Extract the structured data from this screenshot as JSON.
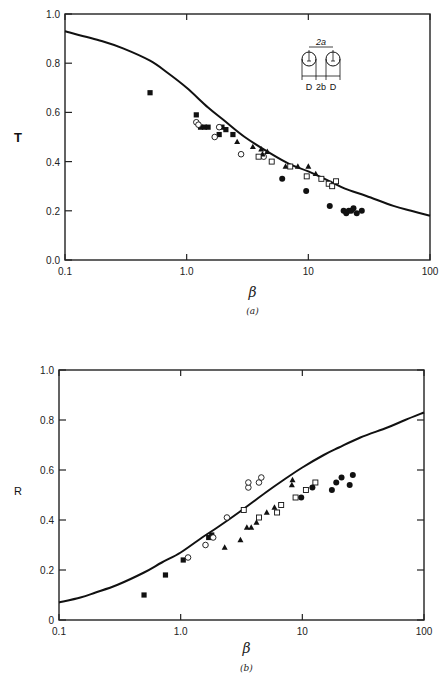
{
  "chart_data": [
    {
      "panel": "(a)",
      "type": "scatter",
      "title": "",
      "xlabel": "β",
      "ylabel": "T",
      "xscale": "log",
      "xlim": [
        0.1,
        100
      ],
      "ylim": [
        0.0,
        1.0
      ],
      "xticks": [
        "0.1",
        "1.0",
        "10",
        "100"
      ],
      "yticks": [
        "0.0",
        "0.2",
        "0.4",
        "0.6",
        "0.8",
        "1.0"
      ],
      "grid": false,
      "legend": null,
      "inset_labels": [
        "2a",
        "D",
        "2b",
        "D"
      ],
      "theory_curve": {
        "x": [
          0.1,
          0.2,
          0.3,
          0.5,
          0.7,
          1.0,
          1.5,
          2.0,
          3.0,
          5.0,
          7.0,
          10,
          15,
          20,
          30,
          50,
          70,
          100
        ],
        "y": [
          0.93,
          0.89,
          0.86,
          0.81,
          0.76,
          0.7,
          0.62,
          0.57,
          0.5,
          0.43,
          0.39,
          0.36,
          0.32,
          0.29,
          0.26,
          0.22,
          0.2,
          0.18
        ]
      },
      "series": [
        {
          "name": "filled-square",
          "marker": "■",
          "x": [
            0.5,
            1.2,
            1.3,
            1.4,
            1.5,
            1.85,
            1.95,
            2.1,
            2.4
          ],
          "y": [
            0.68,
            0.59,
            0.54,
            0.54,
            0.54,
            0.51,
            0.54,
            0.53,
            0.51
          ]
        },
        {
          "name": "open-circle",
          "marker": "○",
          "x": [
            1.2,
            1.25,
            1.7,
            1.85,
            2.8,
            4.3
          ],
          "y": [
            0.56,
            0.55,
            0.5,
            0.54,
            0.43,
            0.42
          ]
        },
        {
          "name": "filled-triangle",
          "marker": "▲",
          "x": [
            2.6,
            3.5,
            4.1,
            4.2,
            4.6,
            6.5,
            8.2,
            10.0,
            11.5
          ],
          "y": [
            0.48,
            0.46,
            0.45,
            0.43,
            0.44,
            0.38,
            0.38,
            0.38,
            0.35
          ]
        },
        {
          "name": "open-square",
          "marker": "□",
          "x": [
            3.9,
            5.0,
            7.1,
            9.7,
            12.8,
            14.7,
            15.7,
            16.9
          ],
          "y": [
            0.42,
            0.4,
            0.38,
            0.34,
            0.33,
            0.31,
            0.3,
            0.32
          ]
        },
        {
          "name": "filled-circle",
          "marker": "●",
          "x": [
            6.1,
            9.6,
            15.0,
            19.5,
            20.5,
            21.5,
            22.5,
            23.5,
            25.0,
            27.5
          ],
          "y": [
            0.33,
            0.28,
            0.22,
            0.2,
            0.19,
            0.2,
            0.2,
            0.21,
            0.19,
            0.2
          ]
        }
      ]
    },
    {
      "panel": "(b)",
      "type": "scatter",
      "title": "",
      "xlabel": "β",
      "ylabel": "R",
      "xscale": "log",
      "xlim": [
        0.1,
        100
      ],
      "ylim": [
        0,
        1.0
      ],
      "xticks": [
        "0.1",
        "1.0",
        "10",
        "100"
      ],
      "yticks": [
        "0",
        "0.2",
        "0.4",
        "0.6",
        "0.8",
        "1.0"
      ],
      "grid": false,
      "legend": null,
      "theory_curve": {
        "x": [
          0.1,
          0.15,
          0.2,
          0.3,
          0.5,
          0.7,
          1.0,
          1.5,
          2.0,
          3.0,
          5.0,
          7.0,
          10,
          15,
          20,
          30,
          50,
          70,
          100
        ],
        "y": [
          0.07,
          0.09,
          0.11,
          0.14,
          0.19,
          0.23,
          0.27,
          0.33,
          0.37,
          0.43,
          0.51,
          0.56,
          0.61,
          0.66,
          0.69,
          0.73,
          0.77,
          0.8,
          0.83
        ]
      },
      "series": [
        {
          "name": "filled-square",
          "marker": "■",
          "x": [
            0.5,
            0.75,
            1.05,
            1.7,
            1.8
          ],
          "y": [
            0.1,
            0.18,
            0.24,
            0.33,
            0.34
          ]
        },
        {
          "name": "open-circle",
          "marker": "○",
          "x": [
            1.15,
            1.6,
            1.85,
            2.4,
            3.6,
            3.6,
            4.4,
            4.6
          ],
          "y": [
            0.25,
            0.3,
            0.33,
            0.41,
            0.53,
            0.55,
            0.55,
            0.57
          ]
        },
        {
          "name": "filled-triangle",
          "marker": "▲",
          "x": [
            2.3,
            3.1,
            3.5,
            3.8,
            4.2,
            5.1,
            5.9,
            8.2,
            8.3
          ],
          "y": [
            0.29,
            0.32,
            0.37,
            0.37,
            0.39,
            0.43,
            0.45,
            0.54,
            0.56
          ]
        },
        {
          "name": "open-square",
          "marker": "□",
          "x": [
            3.3,
            4.4,
            6.2,
            6.7,
            8.8,
            10.7,
            12.8
          ],
          "y": [
            0.44,
            0.41,
            0.43,
            0.46,
            0.49,
            0.52,
            0.55
          ]
        },
        {
          "name": "filled-circle",
          "marker": "●",
          "x": [
            9.8,
            12.1,
            17.5,
            19.0,
            21.0,
            24.5,
            26.0
          ],
          "y": [
            0.49,
            0.53,
            0.52,
            0.55,
            0.57,
            0.54,
            0.58
          ]
        }
      ]
    }
  ],
  "labels": {
    "panel_a_tag": "(a)",
    "panel_b_tag": "(b)",
    "panel_a_ylabel": "T",
    "panel_b_ylabel": "R",
    "xlabel": "β"
  }
}
